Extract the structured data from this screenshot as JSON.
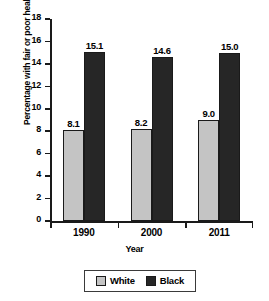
{
  "chart_data": {
    "type": "bar",
    "title": "",
    "xlabel": "Year",
    "ylabel": "Percentage with fair or poor health",
    "categories": [
      "1990",
      "2000",
      "2011"
    ],
    "series": [
      {
        "name": "White",
        "values": [
          8.1,
          8.2,
          9.0
        ],
        "color": "#c4c4c4"
      },
      {
        "name": "Black",
        "values": [
          15.1,
          14.6,
          15.0
        ],
        "color": "#262626"
      }
    ],
    "value_labels": [
      [
        "8.1",
        "15.1"
      ],
      [
        "8.2",
        "14.6"
      ],
      [
        "9.0",
        "15.0"
      ]
    ],
    "ylim": [
      0,
      18
    ],
    "yticks": [
      0,
      2,
      4,
      6,
      8,
      10,
      12,
      14,
      16,
      18
    ],
    "ytick_labels": [
      "0",
      "2",
      "4",
      "6",
      "8",
      "10",
      "12",
      "14",
      "16",
      "18"
    ],
    "grid": false,
    "legend_position": "bottom-center",
    "legend": [
      "White",
      "Black"
    ]
  }
}
